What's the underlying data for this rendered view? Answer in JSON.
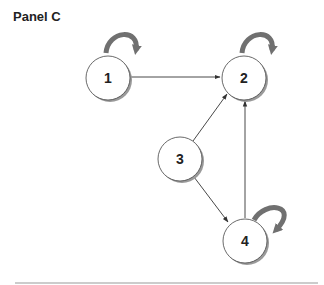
{
  "title": "Panel C",
  "nodes": [
    {
      "id": "1",
      "label": "1",
      "cx": 108,
      "cy": 78,
      "self_loop": true
    },
    {
      "id": "2",
      "label": "2",
      "cx": 244,
      "cy": 78,
      "self_loop": true
    },
    {
      "id": "3",
      "label": "3",
      "cx": 180,
      "cy": 159,
      "self_loop": false
    },
    {
      "id": "4",
      "label": "4",
      "cx": 245,
      "cy": 241,
      "self_loop": true
    }
  ],
  "edges": [
    {
      "from": "1",
      "to": "2",
      "bidirectional": true
    },
    {
      "from": "3",
      "to": "2",
      "bidirectional": false
    },
    {
      "from": "3",
      "to": "4",
      "bidirectional": false
    },
    {
      "from": "4",
      "to": "2",
      "bidirectional": false
    }
  ],
  "colors": {
    "loop": "#707070",
    "edge": "#333333",
    "node_stroke": "#444444",
    "node_shadow": "#9a9a9a",
    "divider": "#999999"
  }
}
